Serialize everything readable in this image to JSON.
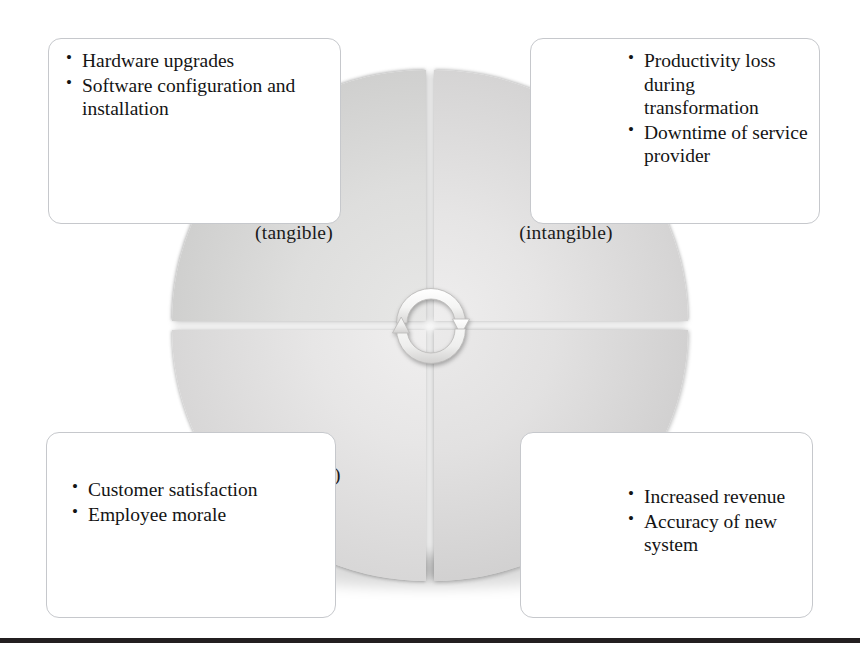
{
  "diagram": {
    "type": "quadrant-wheel",
    "center_icon": "cycle-arrows-icon",
    "quadrants": [
      {
        "id": "costs-tangible",
        "position": "top-left",
        "label": "Costs\n(tangible)",
        "label_line1": "Costs",
        "label_line2": "(tangible)",
        "fill": "#d6d5d4"
      },
      {
        "id": "costs-intangible",
        "position": "top-right",
        "label": "Costs\n(intangible)",
        "label_line1": "Costs",
        "label_line2": "(intangible)",
        "fill": "#dddcdc"
      },
      {
        "id": "benefits-intangible",
        "position": "bottom-left",
        "label": "Benefits\n(intangible)",
        "label_line1": "Benefits",
        "label_line2": "(intangible)",
        "fill": "#dedddd"
      },
      {
        "id": "benefits-tangible",
        "position": "bottom-right",
        "label": "Benefits\n(tangible)",
        "label_line1": "Benefits",
        "label_line2": "(tangible)",
        "fill": "#d9d8d8"
      }
    ]
  },
  "callouts": {
    "top_left": {
      "for_quadrant": "costs-tangible",
      "items": [
        "Hardware upgrades",
        "Software configuration and installation"
      ]
    },
    "top_right": {
      "for_quadrant": "costs-intangible",
      "items": [
        "Productivity loss during transformation",
        "Downtime of service provider"
      ]
    },
    "bottom_left": {
      "for_quadrant": "benefits-intangible",
      "items": [
        "Customer satisfaction",
        "Employee morale"
      ]
    },
    "bottom_right": {
      "for_quadrant": "benefits-tangible",
      "items": [
        "Increased revenue",
        "Accuracy of new system"
      ]
    }
  },
  "colors": {
    "page_background": "#ffffff",
    "text": "#141414",
    "callout_border": "#c6c8cc",
    "rule": "#231f20",
    "wheel_light": "#efeeee",
    "wheel_dark": "#c2c2c1"
  }
}
